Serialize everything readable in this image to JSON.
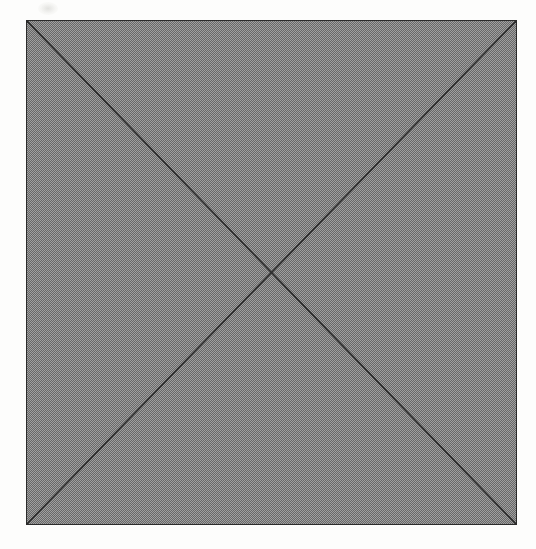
{
  "page": {
    "background_color": "#fdfdfc",
    "width": 536,
    "height": 549,
    "caption": ""
  },
  "figure": {
    "title": "",
    "square": {
      "x": 26,
      "y": 20,
      "width": 491,
      "height": 505,
      "fill_color": "#a3a3a3",
      "fill_pattern": "halftone-checkerboard-dither",
      "border_color": "#2b2b2b",
      "border_width": 1.4
    },
    "diagonals": {
      "stroke_color": "#2b2b2b",
      "stroke_width": 1.6,
      "lines": [
        {
          "name": "diagonal-top-left-to-bottom-right",
          "x1": 0,
          "y1": 0,
          "x2": 491,
          "y2": 505
        },
        {
          "name": "diagonal-top-right-to-bottom-left",
          "x1": 491,
          "y1": 0,
          "x2": 0,
          "y2": 505
        }
      ],
      "intersection": {
        "x": 245.5,
        "y": 252.5
      }
    },
    "vertices": [
      {
        "name": "top-left",
        "x": 26,
        "y": 20
      },
      {
        "name": "top-right",
        "x": 517,
        "y": 20
      },
      {
        "name": "bottom-right",
        "x": 517,
        "y": 525
      },
      {
        "name": "bottom-left",
        "x": 26,
        "y": 525
      }
    ],
    "artifact": {
      "name": "scan-smudge",
      "x": 38,
      "y": 2,
      "width": 20,
      "height": 13
    }
  },
  "chart_data": {
    "type": "diagram",
    "title": "",
    "xlabel": "",
    "ylabel": "",
    "shapes": [
      {
        "kind": "rectangle",
        "label": "square",
        "points": [
          [
            0,
            0
          ],
          [
            1,
            0
          ],
          [
            1,
            1
          ],
          [
            0,
            1
          ]
        ],
        "fill": "#a3a3a3",
        "stroke": "#2b2b2b"
      },
      {
        "kind": "line",
        "label": "diagonal-1",
        "points": [
          [
            0,
            0
          ],
          [
            1,
            1
          ]
        ],
        "stroke": "#2b2b2b"
      },
      {
        "kind": "line",
        "label": "diagonal-2",
        "points": [
          [
            1,
            0
          ],
          [
            0,
            1
          ]
        ],
        "stroke": "#2b2b2b"
      }
    ],
    "annotations": []
  }
}
